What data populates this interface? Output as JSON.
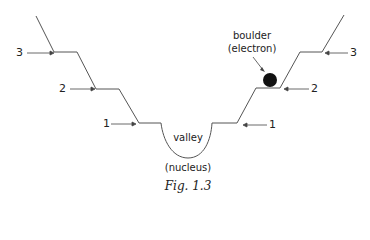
{
  "figure": {
    "caption": "Fig. 1.3",
    "valley_label": "valley",
    "nucleus_label": "(nucleus)",
    "boulder_label_line1": "boulder",
    "boulder_label_line2": "(electron)",
    "levels_left": [
      {
        "id": "3",
        "label": "3"
      },
      {
        "id": "2",
        "label": "2"
      },
      {
        "id": "1",
        "label": "1"
      }
    ],
    "levels_right": [
      {
        "id": "3",
        "label": "3"
      },
      {
        "id": "2",
        "label": "2"
      },
      {
        "id": "1",
        "label": "1"
      }
    ],
    "colors": {
      "line": "#555555",
      "boulder": "#111111",
      "text": "#222222"
    }
  }
}
